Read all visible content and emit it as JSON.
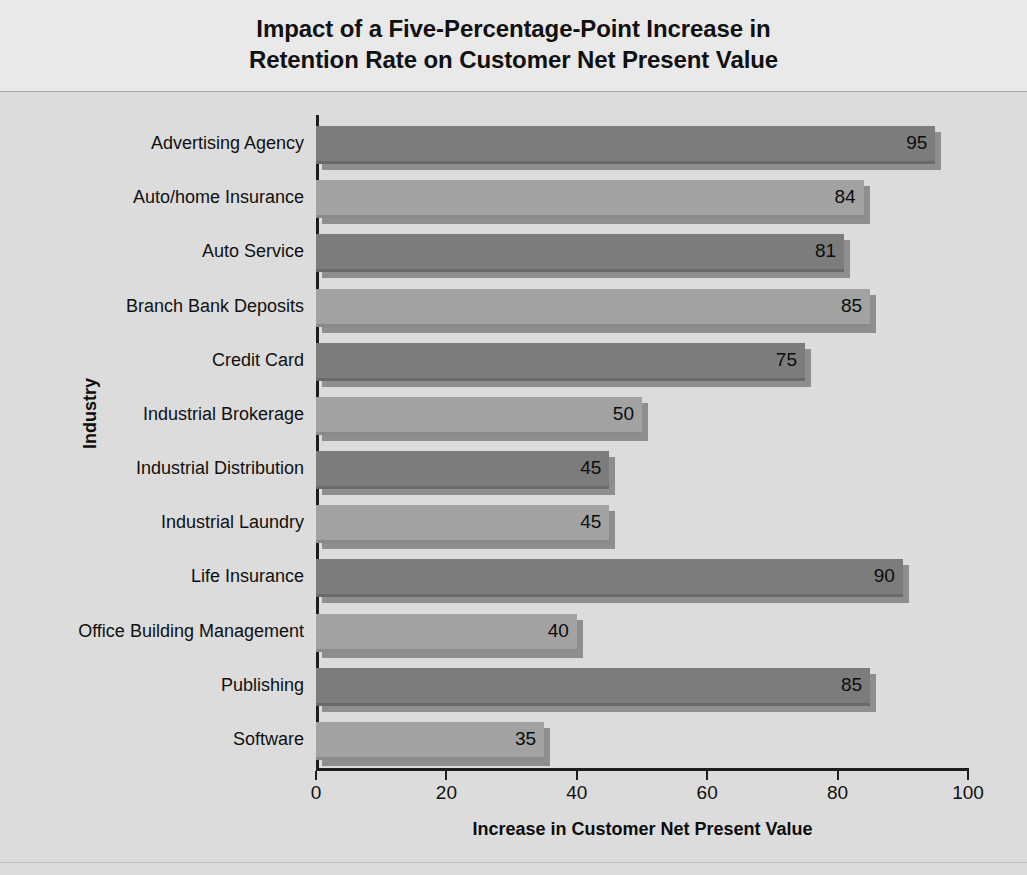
{
  "chart_data": {
    "type": "bar",
    "orientation": "horizontal",
    "title": "Impact of a Five-Percentage-Point Increase in Retention Rate on Customer Net Present Value",
    "title_lines": [
      "Impact of a Five-Percentage-Point Increase in",
      "Retention Rate on Customer Net Present Value"
    ],
    "xlabel": "Increase in Customer Net Present Value",
    "ylabel": "Industry",
    "xlim": [
      0,
      100
    ],
    "xticks": [
      0,
      20,
      40,
      60,
      80,
      100
    ],
    "xtick_labels": [
      "0",
      "20",
      "40",
      "60",
      "80",
      "100"
    ],
    "grid": false,
    "legend": false,
    "categories": [
      "Advertising Agency",
      "Auto/home Insurance",
      "Auto Service",
      "Branch Bank Deposits",
      "Credit Card",
      "Industrial Brokerage",
      "Industrial Distribution",
      "Industrial Laundry",
      "Life Insurance",
      "Office Building Management",
      "Publishing",
      "Software"
    ],
    "values": [
      95,
      84,
      81,
      85,
      75,
      50,
      45,
      45,
      90,
      40,
      85,
      35
    ],
    "value_labels": [
      "95",
      "84",
      "81",
      "85",
      "75",
      "50",
      "45",
      "45",
      "90",
      "40",
      "85",
      "35"
    ],
    "bar_shades": [
      "dark",
      "light",
      "dark",
      "light",
      "dark",
      "light",
      "dark",
      "light",
      "dark",
      "light",
      "dark",
      "light"
    ]
  },
  "colors": {
    "background": "#dcdcdc",
    "title_panel": "#e9e9e9",
    "bar_dark": "#7c7c7c",
    "bar_light": "#a2a2a2",
    "bar_shadow": "#8e8e8e",
    "axis": "#1d1d1d",
    "text": "#101010"
  }
}
